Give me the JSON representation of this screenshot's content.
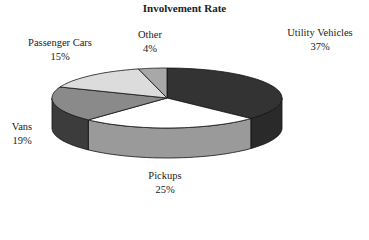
{
  "chart_data": {
    "type": "pie",
    "title": "Involvement Rate",
    "style": "3d",
    "categories": [
      "Utility Vehicles",
      "Pickups",
      "Vans",
      "Passenger Cars",
      "Other"
    ],
    "values": [
      37,
      25,
      19,
      15,
      4
    ],
    "value_labels": [
      "37%",
      "25%",
      "19%",
      "15%",
      "4%"
    ],
    "legend": "none (labels adjacent to slices)",
    "colors_top": [
      "#333333",
      "#ffffff",
      "#8a8a8a",
      "#dcdcdc",
      "#a8a8a8"
    ],
    "colors_side": [
      "#2a2a2a",
      "#9a9a9a",
      "#3c3c3c",
      "#bbbbbb",
      "#909090"
    ]
  },
  "labels": {
    "utility": {
      "name": "Utility Vehicles",
      "pct": "37%"
    },
    "pickups": {
      "name": "Pickups",
      "pct": "25%"
    },
    "vans": {
      "name": "Vans",
      "pct": "19%"
    },
    "passenger": {
      "name": "Passenger Cars",
      "pct": "15%"
    },
    "other": {
      "name": "Other",
      "pct": "4%"
    }
  }
}
